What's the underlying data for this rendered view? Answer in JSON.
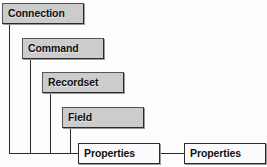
{
  "diagram": {
    "type": "hierarchy-cascade",
    "colors": {
      "box_fill": "#cccccc",
      "box_fill_plain": "#fbfbfb",
      "border": "#2b2b2b",
      "shadow": "#9a9a9a",
      "background": "#fdfdfd",
      "text": "#111111"
    },
    "nodes": [
      {
        "id": "connection",
        "label": "Connection",
        "style": "filled",
        "x": 2,
        "y": 3,
        "w": 82,
        "h": 21,
        "stem_x": 9
      },
      {
        "id": "command",
        "label": "Command",
        "style": "filled",
        "x": 22,
        "y": 38,
        "w": 82,
        "h": 21,
        "stem_x": 30
      },
      {
        "id": "recordset",
        "label": "Recordset",
        "style": "filled",
        "x": 42,
        "y": 72,
        "w": 82,
        "h": 21,
        "stem_x": 50
      },
      {
        "id": "field",
        "label": "Field",
        "style": "filled",
        "x": 62,
        "y": 107,
        "w": 82,
        "h": 21,
        "stem_x": 70
      },
      {
        "id": "properties-left",
        "label": "Properties",
        "style": "plain",
        "x": 78,
        "y": 143,
        "w": 82,
        "h": 21,
        "stem_x": null
      },
      {
        "id": "properties-right",
        "label": "Properties",
        "style": "plain",
        "x": 184,
        "y": 143,
        "w": 82,
        "h": 21,
        "stem_x": null
      }
    ],
    "rail": {
      "x": 9,
      "y": 153,
      "w": 69
    },
    "link": {
      "x": 160,
      "y": 153,
      "w": 24
    }
  }
}
